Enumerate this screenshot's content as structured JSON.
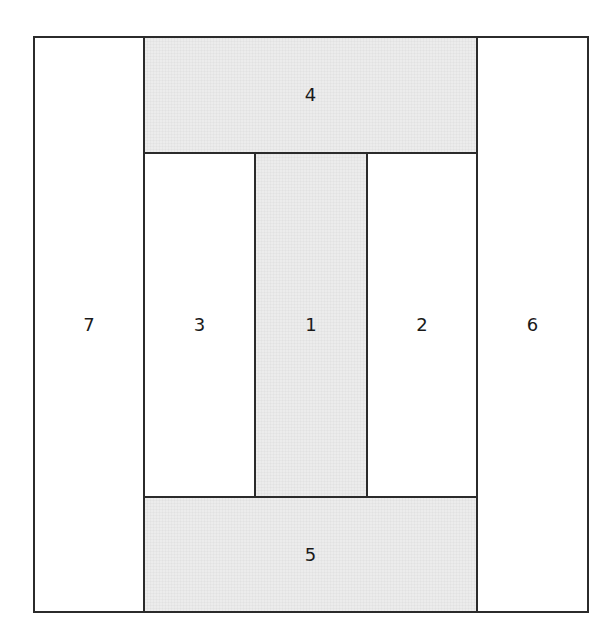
{
  "diagram": {
    "type": "quilt block layout (log-cabin style piecing order)",
    "colors": {
      "shaded_fill": "#ececec",
      "white_fill": "#ffffff",
      "stroke": "#2b2b2b",
      "label": "#1a1a1a"
    },
    "pieces": [
      {
        "id": "1",
        "label": "1",
        "fill": "shaded",
        "position": "center vertical strip"
      },
      {
        "id": "2",
        "label": "2",
        "fill": "white",
        "position": "right of 1"
      },
      {
        "id": "3",
        "label": "3",
        "fill": "white",
        "position": "left of 1"
      },
      {
        "id": "4",
        "label": "4",
        "fill": "shaded",
        "position": "top horizontal strip"
      },
      {
        "id": "5",
        "label": "5",
        "fill": "shaded",
        "position": "bottom horizontal strip"
      },
      {
        "id": "6",
        "label": "6",
        "fill": "white",
        "position": "right outer column"
      },
      {
        "id": "7",
        "label": "7",
        "fill": "white",
        "position": "left outer column"
      }
    ]
  }
}
